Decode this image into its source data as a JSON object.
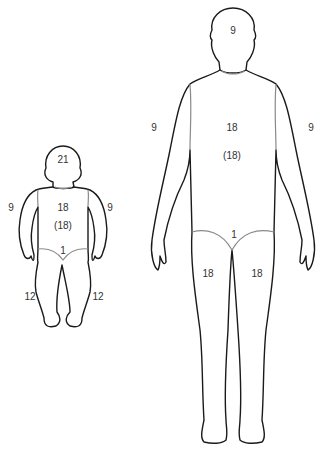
{
  "infant": {
    "head": "21",
    "trunk_front": "18",
    "trunk_back": "(18)",
    "arm_left": "9",
    "arm_right": "9",
    "genitalia": "1",
    "leg_left": "12",
    "leg_right": "12"
  },
  "adult": {
    "head": "9",
    "trunk_front": "18",
    "trunk_back": "(18)",
    "arm_left": "9",
    "arm_right": "9",
    "genitalia": "1",
    "leg_left": "18",
    "leg_right": "18"
  },
  "colors": {
    "outline": "#1a1a1a",
    "divider": "#8a8a8a",
    "label": "#333333"
  }
}
